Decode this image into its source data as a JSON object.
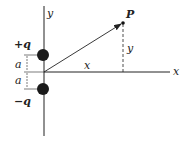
{
  "diagram": {
    "axes": {
      "x_label": "x",
      "y_label": "y"
    },
    "charges": [
      {
        "label": "+q",
        "position": "above origin"
      },
      {
        "label": "−q",
        "position": "below origin"
      }
    ],
    "distances": [
      {
        "label": "a",
        "between": "+q and origin"
      },
      {
        "label": "a",
        "between": "origin and −q"
      }
    ],
    "point": {
      "label": "P"
    },
    "segments": {
      "x_label": "x",
      "y_label": "y"
    },
    "colors": {
      "ink": "#222222",
      "background": "#ffffff"
    }
  }
}
